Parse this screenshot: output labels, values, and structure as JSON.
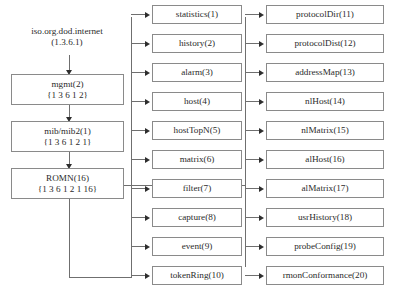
{
  "diagram": {
    "root": {
      "label": "iso.org.dod.internet",
      "oid": "(1.3.6.1)"
    },
    "trunk": [
      {
        "label": "mgmt(2)",
        "oid": "{1 3 6 1 2}"
      },
      {
        "label": "mib/mib2(1)",
        "oid": "{1 3 6 1 2 1}"
      },
      {
        "label": "ROMN(16)",
        "oid": "{1 3 6 1 2 1 16}"
      }
    ],
    "middle_column": [
      {
        "label": "statistics(1)"
      },
      {
        "label": "history(2)"
      },
      {
        "label": "alarm(3)"
      },
      {
        "label": "host(4)"
      },
      {
        "label": "hostTopN(5)"
      },
      {
        "label": "matrix(6)"
      },
      {
        "label": "filter(7)"
      },
      {
        "label": "capture(8)"
      },
      {
        "label": "event(9)"
      },
      {
        "label": "tokenRing(10)"
      }
    ],
    "right_column": [
      {
        "label": "protocolDir(11)"
      },
      {
        "label": "protocolDist(12)"
      },
      {
        "label": "addressMap(13)"
      },
      {
        "label": "nlHost(14)"
      },
      {
        "label": "nlMatrix(15)"
      },
      {
        "label": "alHost(16)"
      },
      {
        "label": "alMatrix(17)"
      },
      {
        "label": "usrHistory(18)"
      },
      {
        "label": "probeConfig(19)"
      },
      {
        "label": "rmonConformance(20)"
      }
    ],
    "caption": "",
    "colors": {
      "box_border": "#8a8a8a",
      "connector": "#6f6f6f",
      "arrow": "#2e2e2e",
      "text": "#2b2b2b",
      "background": "#ffffff"
    }
  }
}
